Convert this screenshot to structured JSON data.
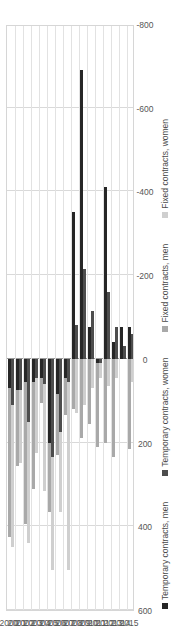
{
  "chart_data": {
    "type": "bar",
    "orientation": "horizontal-rotated",
    "stacked": true,
    "title": "",
    "xlabel": "",
    "ylabel": "",
    "grid": true,
    "legend_position": "bottom",
    "value_axis": {
      "ticks": [
        "600",
        "400",
        "200",
        "0",
        "-200",
        "-400",
        "-600",
        "-800"
      ],
      "values": [
        600,
        400,
        200,
        0,
        -200,
        -400,
        -600,
        -800
      ],
      "min": -800,
      "max": 600
    },
    "categories": [
      "2000",
      "2001",
      "2002",
      "2003",
      "2004",
      "2005",
      "2006",
      "2007",
      "2008",
      "2009",
      "2010",
      "2011",
      "2012",
      "2013",
      "2014",
      "2015"
    ],
    "series": [
      {
        "name": "Temporary contracts, men",
        "color": "#262626",
        "group": "men",
        "values": [
          70,
          75,
          55,
          55,
          45,
          200,
          85,
          45,
          -350,
          -690,
          -75,
          10,
          -410,
          -40,
          -75,
          -75
        ]
      },
      {
        "name": "Fixed contracts, men",
        "color": "#a9a9a9",
        "group": "men",
        "values": [
          355,
          180,
          340,
          255,
          60,
          165,
          145,
          90,
          120,
          190,
          155,
          200,
          200,
          235,
          0,
          215
        ]
      },
      {
        "name": "Temporary contracts, women",
        "color": "#4d4d4d",
        "group": "women",
        "values": [
          110,
          75,
          150,
          45,
          60,
          235,
          175,
          55,
          -80,
          -215,
          -115,
          10,
          -160,
          -75,
          -30,
          -60
        ]
      },
      {
        "name": "Fixed contracts, women",
        "color": "#cfcfcf",
        "group": "women",
        "values": [
          340,
          175,
          290,
          180,
          255,
          270,
          190,
          450,
          130,
          110,
          70,
          35,
          65,
          45,
          0,
          55
        ]
      }
    ]
  },
  "legend": {
    "items": [
      {
        "label": "Temporary contracts, men",
        "swatch": "temp-men"
      },
      {
        "label": "Temporary contracts, women",
        "swatch": "temp-women"
      },
      {
        "label": "Fixed contracts, men",
        "swatch": "fix-men"
      },
      {
        "label": "Fixed contracts, women",
        "swatch": "fix-women"
      }
    ]
  }
}
